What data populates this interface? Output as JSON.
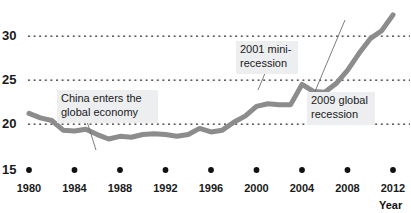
{
  "chart_data": {
    "type": "line",
    "title": "",
    "xlabel": "Year",
    "ylabel": "",
    "xlim": [
      1980,
      2013
    ],
    "ylim": [
      15,
      33
    ],
    "grid": true,
    "grid_style": "dotted-horizontal",
    "legend": "none",
    "series_color": "#8c8c8c",
    "x": [
      1980,
      1981,
      1982,
      1983,
      1984,
      1985,
      1986,
      1987,
      1988,
      1989,
      1990,
      1991,
      1992,
      1993,
      1994,
      1995,
      1996,
      1997,
      1998,
      1999,
      2000,
      2001,
      2002,
      2003,
      2004,
      2005,
      2006,
      2007,
      2008,
      2009,
      2010,
      2011,
      2012
    ],
    "values": [
      21.2,
      20.7,
      20.4,
      19.3,
      19.2,
      19.4,
      18.8,
      18.3,
      18.6,
      18.5,
      18.8,
      18.9,
      18.8,
      18.6,
      18.8,
      19.5,
      19.1,
      19.3,
      20.2,
      20.9,
      22.0,
      22.3,
      22.2,
      22.2,
      24.5,
      23.7,
      23.6,
      24.6,
      26.1,
      28.0,
      29.7,
      30.6,
      32.4
    ],
    "note_series_detail": "line traced from pixels; 2008 peak 32.4, 2009 trough 26.7, recovery to 30.6 by 2012",
    "y_ticks": [
      {
        "value": 30,
        "label": "30",
        "gridline": true
      },
      {
        "value": 25,
        "label": "25",
        "gridline": true
      },
      {
        "value": 20,
        "label": "20",
        "gridline": true
      },
      {
        "value": 15,
        "label": "15",
        "gridline": false
      }
    ],
    "x_ticks": [
      {
        "value": 1980,
        "label": "1980"
      },
      {
        "value": 1984,
        "label": "1984"
      },
      {
        "value": 1988,
        "label": "1988"
      },
      {
        "value": 1992,
        "label": "1992"
      },
      {
        "value": 1996,
        "label": "1996"
      },
      {
        "value": 2000,
        "label": "2000"
      },
      {
        "value": 2004,
        "label": "2004"
      },
      {
        "value": 2008,
        "label": "2008"
      },
      {
        "value": 2012,
        "label": "2012"
      }
    ],
    "x_tick_markers": "black round dots drawn at y = 15 baseline under each labelled year",
    "annotations": [
      {
        "id": "china-entry",
        "text": "China enters the\nglobal economy",
        "points_to_year": 1986,
        "points_to_value": 18.8
      },
      {
        "id": "mini-recession-2001",
        "text": "2001 mini-\nrecession",
        "points_to_year": 2001,
        "points_to_value": 22.3
      },
      {
        "id": "global-recession-2009",
        "text": "2009 global\nrecession",
        "points_to_year": 2009,
        "points_to_value": 26.7
      }
    ]
  },
  "axis": {
    "x_title": "Year"
  }
}
